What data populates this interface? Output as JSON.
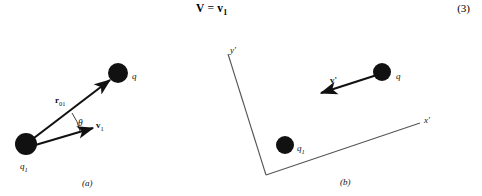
{
  "page": {
    "background_color": "#ffffff",
    "ink_color": "#111111"
  },
  "equation": {
    "lhs": "V",
    "relation": "=",
    "rhs_symbol": "v",
    "rhs_subscript": "1",
    "number": "(3)"
  },
  "figure": {
    "panels": [
      {
        "id": "panel-a",
        "caption": "(a)",
        "caption_pos": {
          "x": 82,
          "y": 179
        },
        "charges": [
          {
            "name": "charge-q1",
            "label": "q",
            "sublabel": "1",
            "cx": 26,
            "cy": 144,
            "r": 11,
            "label_pos": {
              "x": 20,
              "y": 162
            }
          },
          {
            "name": "charge-q",
            "label": "q",
            "sublabel": "",
            "cx": 118,
            "cy": 73,
            "r": 10,
            "label_pos": {
              "x": 132,
              "y": 72
            }
          }
        ],
        "vectors": [
          {
            "name": "vector-r01",
            "label": "r",
            "sublabel": "01",
            "x1": 30,
            "y1": 141,
            "x2": 110,
            "y2": 80,
            "label_pos": {
              "x": 55,
              "y": 96
            }
          },
          {
            "name": "vector-v1",
            "label": "v",
            "sublabel": "1",
            "x1": 32,
            "y1": 146,
            "x2": 93,
            "y2": 128,
            "label_pos": {
              "x": 96,
              "y": 121
            }
          }
        ],
        "angle": {
          "name": "angle-theta",
          "label": "θ",
          "label_pos": {
            "x": 78,
            "y": 119
          },
          "arc": {
            "cx": 34,
            "cy": 145,
            "r": 48,
            "start_deg": -16,
            "end_deg": -37
          }
        }
      },
      {
        "id": "panel-b",
        "caption": "(b)",
        "caption_pos": {
          "x": 340,
          "y": 178
        },
        "axes": [
          {
            "name": "axis-y-prime",
            "label": "y'",
            "x1": 266,
            "y1": 175,
            "x2": 228,
            "y2": 54,
            "label_pos": {
              "x": 230,
              "y": 46
            }
          },
          {
            "name": "axis-x-prime",
            "label": "x'",
            "x1": 266,
            "y1": 175,
            "x2": 420,
            "y2": 123,
            "label_pos": {
              "x": 424,
              "y": 116
            }
          }
        ],
        "charges": [
          {
            "name": "charge-q1",
            "label": "q",
            "sublabel": "1",
            "cx": 285,
            "cy": 145,
            "r": 9,
            "label_pos": {
              "x": 297,
              "y": 144
            }
          },
          {
            "name": "charge-q",
            "label": "q",
            "sublabel": "",
            "cx": 382,
            "cy": 72,
            "r": 9,
            "label_pos": {
              "x": 396,
              "y": 72
            }
          }
        ],
        "vectors": [
          {
            "name": "vector-v-prime",
            "label": "v'",
            "sublabel": "",
            "x1": 380,
            "y1": 74,
            "x2": 321,
            "y2": 93,
            "label_pos": {
              "x": 330,
              "y": 76
            }
          }
        ]
      }
    ]
  }
}
